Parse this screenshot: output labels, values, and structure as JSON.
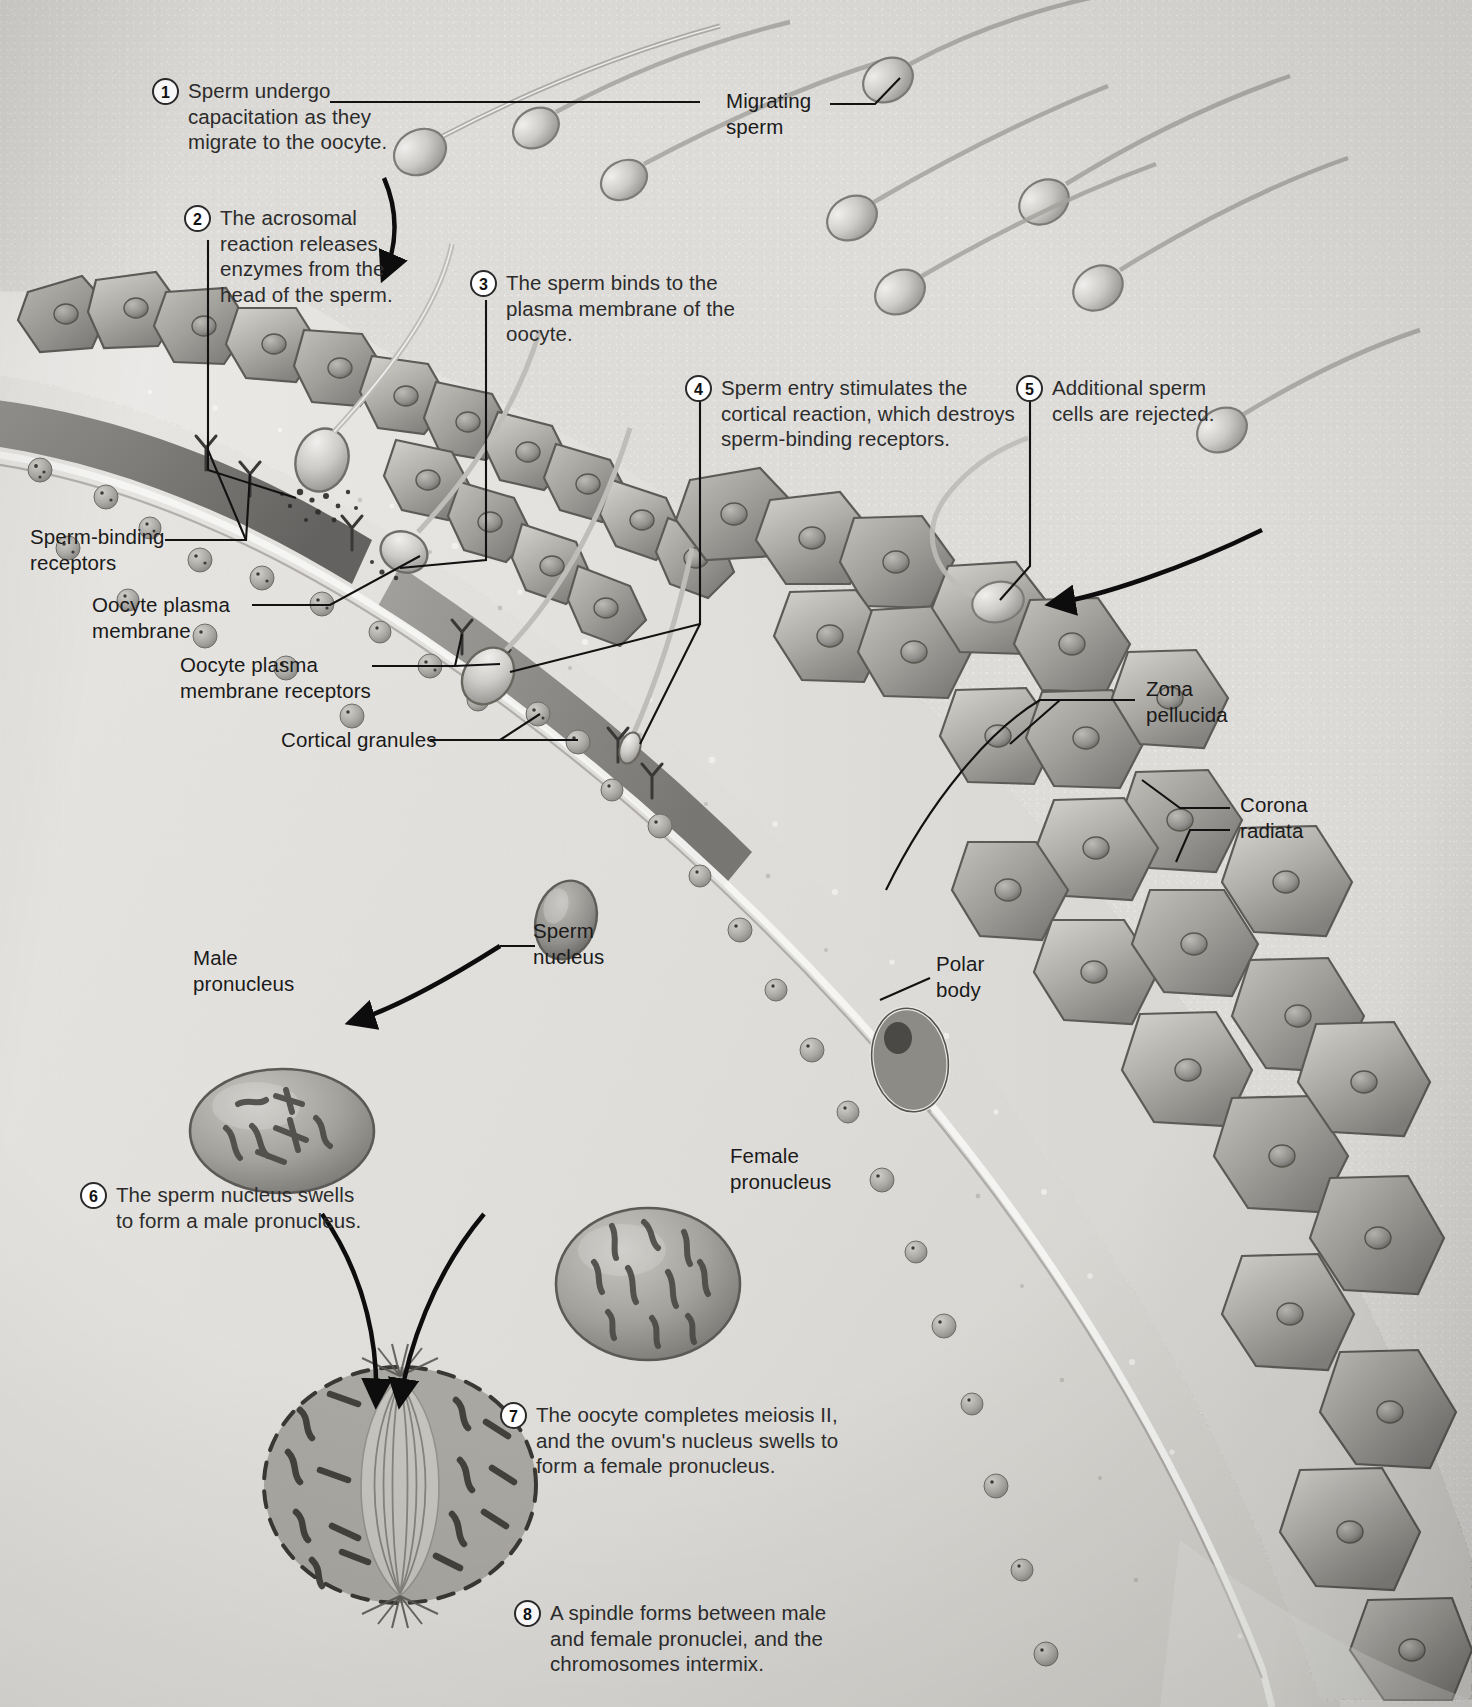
{
  "figure": {
    "type": "biological-illustration"
  },
  "steps": [
    {
      "n": "1",
      "text": "Sperm undergo\ncapacitation as they\nmigrate to the oocyte."
    },
    {
      "n": "2",
      "text": "The acrosomal\nreaction releases\nenzymes from the\nhead of the sperm."
    },
    {
      "n": "3",
      "text": "The sperm binds to the\nplasma membrane of the\noocyte."
    },
    {
      "n": "4",
      "text": "Sperm entry stimulates the\ncortical reaction, which destroys\nsperm-binding receptors."
    },
    {
      "n": "5",
      "text": "Additional sperm\ncells are rejected."
    },
    {
      "n": "6",
      "text": "The sperm nucleus swells\nto form a male pronucleus."
    },
    {
      "n": "7",
      "text": "The oocyte completes meiosis II,\nand the ovum's nucleus swells to\nform a female pronucleus."
    },
    {
      "n": "8",
      "text": "A spindle forms between male\nand female pronuclei, and the\nchromosomes intermix."
    }
  ],
  "labels": [
    {
      "id": "migrating-sperm",
      "text": "Migrating\nsperm"
    },
    {
      "id": "sperm-binding-receptors",
      "text": "Sperm-binding\nreceptors"
    },
    {
      "id": "oocyte-plasma-membrane",
      "text": "Oocyte plasma\nmembrane"
    },
    {
      "id": "oocyte-plasma-membrane-receptors",
      "text": "Oocyte plasma\nmembrane receptors"
    },
    {
      "id": "cortical-granules",
      "text": "Cortical granules"
    },
    {
      "id": "zona-pellucida",
      "text": "Zona\npellucida"
    },
    {
      "id": "corona-radiata",
      "text": "Corona\nradiata"
    },
    {
      "id": "polar-body",
      "text": "Polar\nbody"
    },
    {
      "id": "sperm-nucleus",
      "text": "Sperm\nnucleus"
    },
    {
      "id": "male-pronucleus",
      "text": "Male\npronucleus"
    },
    {
      "id": "female-pronucleus",
      "text": "Female\npronucleus"
    }
  ],
  "colors": {
    "background": "#e6e4e1",
    "ink": "#1a1a1a",
    "leader_line": "#141414",
    "cell_fill": "#9d9c98",
    "cell_stroke": "#5e5d5a",
    "zona_fill": "#cfcdc8",
    "granule_fill": "#b9b7b2",
    "cytoplasm": "#d8d6d2"
  }
}
